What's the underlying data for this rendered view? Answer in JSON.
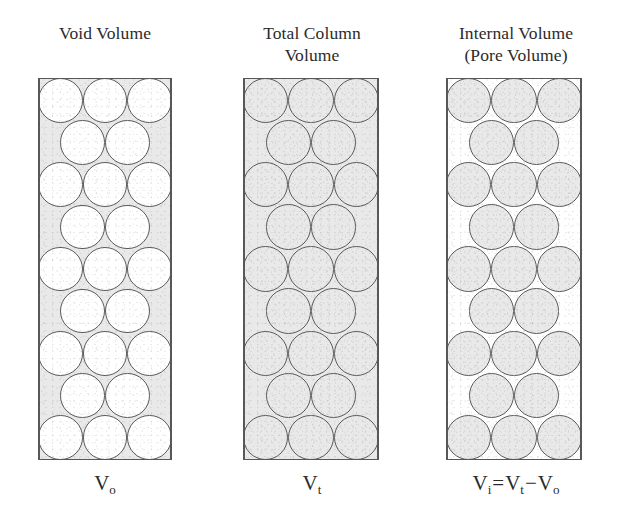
{
  "figure": {
    "caption_absent": true,
    "colors": {
      "shaded_region": "#e9e9e9",
      "unshaded_region": "#ffffff",
      "outline": "#5a5a5a",
      "wall": "#575757",
      "text": "#2b2b2b"
    },
    "packing": {
      "description": "hexagonal close packing of spherical particles in a column",
      "rows": [
        3,
        2,
        3,
        2,
        3,
        2,
        3,
        2,
        3
      ],
      "row_count": 9,
      "particle_count": 23
    }
  },
  "panels": [
    {
      "id": "void-volume",
      "title_lines": [
        "Void Volume"
      ],
      "symbol": {
        "base": "V",
        "subscript": "o",
        "full": "Vo"
      },
      "shading": {
        "background": "gray",
        "particles": "white",
        "meaning": "interstitial space between particles is shaded"
      }
    },
    {
      "id": "total-column-volume",
      "title_lines": [
        "Total Column",
        "Volume"
      ],
      "symbol": {
        "base": "V",
        "subscript": "t",
        "full": "Vt"
      },
      "shading": {
        "background": "gray",
        "particles": "gray",
        "meaning": "entire column interior is shaded"
      }
    },
    {
      "id": "internal-volume",
      "title_lines": [
        "Internal Volume",
        "(Pore Volume)"
      ],
      "symbol": {
        "base": "V",
        "subscript": "i",
        "full": "Vi"
      },
      "equation": {
        "lhs_base": "V",
        "lhs_sub": "i",
        "equals": "=",
        "term1_base": "V",
        "term1_sub": "t",
        "operator": "−",
        "term2_base": "V",
        "term2_sub": "o",
        "full": "Vi = Vt − Vo"
      },
      "shading": {
        "background": "white",
        "particles": "gray",
        "meaning": "only the particle interiors (pores) are shaded"
      }
    }
  ]
}
